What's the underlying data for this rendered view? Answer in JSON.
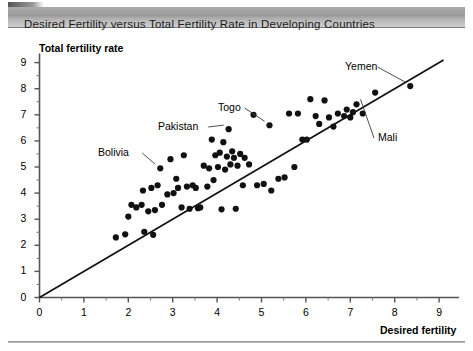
{
  "title": "Desired Fertility versus Total Fertility Rate in Developing Countries",
  "axes": {
    "ylabel": "Total fertility rate",
    "xlabel": "Desired fertility",
    "x_ticks": [
      "0",
      "1",
      "2",
      "3",
      "4",
      "5",
      "6",
      "7",
      "8",
      "9"
    ],
    "y_ticks": [
      "0",
      "1",
      "2",
      "3",
      "4",
      "5",
      "6",
      "7",
      "8",
      "9"
    ]
  },
  "chart_data": {
    "type": "scatter",
    "title": "Desired Fertility versus Total Fertility Rate in Developing Countries",
    "xlabel": "Desired fertility",
    "ylabel": "Total fertility rate",
    "xlim": [
      0,
      9.4
    ],
    "ylim": [
      0,
      9.4
    ],
    "grid": false,
    "legend": null,
    "reference_line": {
      "name": "y = x equality line",
      "from": [
        0,
        0
      ],
      "to": [
        9.1,
        9.1
      ]
    },
    "points": [
      [
        1.72,
        2.3
      ],
      [
        1.93,
        2.42
      ],
      [
        2.0,
        3.1
      ],
      [
        2.07,
        3.55
      ],
      [
        2.18,
        3.45
      ],
      [
        2.3,
        3.55
      ],
      [
        2.33,
        4.1
      ],
      [
        2.36,
        2.52
      ],
      [
        2.45,
        3.3
      ],
      [
        2.52,
        4.2
      ],
      [
        2.56,
        2.4
      ],
      [
        2.6,
        3.35
      ],
      [
        2.66,
        4.3
      ],
      [
        2.72,
        4.95
      ],
      [
        2.76,
        3.55
      ],
      [
        2.88,
        3.95
      ],
      [
        2.95,
        5.3
      ],
      [
        3.02,
        4.0
      ],
      [
        3.08,
        4.55
      ],
      [
        3.12,
        4.2
      ],
      [
        3.2,
        3.45
      ],
      [
        3.25,
        5.45
      ],
      [
        3.32,
        4.25
      ],
      [
        3.38,
        3.4
      ],
      [
        3.45,
        4.3
      ],
      [
        3.52,
        4.2
      ],
      [
        3.57,
        3.42
      ],
      [
        3.62,
        3.45
      ],
      [
        3.7,
        5.05
      ],
      [
        3.78,
        4.25
      ],
      [
        3.82,
        4.95
      ],
      [
        3.88,
        6.05
      ],
      [
        3.92,
        4.5
      ],
      [
        3.96,
        5.45
      ],
      [
        4.02,
        5.0
      ],
      [
        4.06,
        5.55
      ],
      [
        4.1,
        3.38
      ],
      [
        4.14,
        5.95
      ],
      [
        4.18,
        4.9
      ],
      [
        4.22,
        5.4
      ],
      [
        4.26,
        6.45
      ],
      [
        4.3,
        5.1
      ],
      [
        4.34,
        5.6
      ],
      [
        4.38,
        5.35
      ],
      [
        4.42,
        3.4
      ],
      [
        4.46,
        5.05
      ],
      [
        4.52,
        5.5
      ],
      [
        4.58,
        4.3
      ],
      [
        4.62,
        5.35
      ],
      [
        4.72,
        5.1
      ],
      [
        4.82,
        7.0
      ],
      [
        4.9,
        4.3
      ],
      [
        5.05,
        4.35
      ],
      [
        5.18,
        6.6
      ],
      [
        5.22,
        4.1
      ],
      [
        5.38,
        4.55
      ],
      [
        5.52,
        4.6
      ],
      [
        5.62,
        7.05
      ],
      [
        5.74,
        5.0
      ],
      [
        5.82,
        7.05
      ],
      [
        5.92,
        6.05
      ],
      [
        6.02,
        6.05
      ],
      [
        6.1,
        7.6
      ],
      [
        6.22,
        6.95
      ],
      [
        6.3,
        6.65
      ],
      [
        6.42,
        7.55
      ],
      [
        6.52,
        6.9
      ],
      [
        6.62,
        6.55
      ],
      [
        6.72,
        7.05
      ],
      [
        6.86,
        6.95
      ],
      [
        6.92,
        7.2
      ],
      [
        7.0,
        6.9
      ],
      [
        7.06,
        7.1
      ],
      [
        7.14,
        7.4
      ],
      [
        7.28,
        7.05
      ],
      [
        7.56,
        7.85
      ],
      [
        8.35,
        8.1
      ]
    ],
    "annotations": [
      {
        "label": "Bolivia",
        "point": [
          2.72,
          4.95
        ]
      },
      {
        "label": "Pakistan",
        "point": [
          4.26,
          6.45
        ]
      },
      {
        "label": "Togo",
        "point": [
          5.18,
          6.6
        ]
      },
      {
        "label": "Yemen",
        "point": [
          8.35,
          8.1
        ]
      },
      {
        "label": "Mali",
        "point": [
          7.14,
          7.4
        ]
      }
    ]
  }
}
